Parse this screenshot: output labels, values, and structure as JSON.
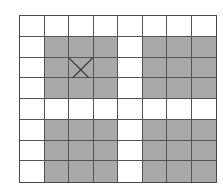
{
  "diagram": {
    "type": "grid",
    "rows": 8,
    "cols": 8,
    "colors": {
      "white": "#ffffff",
      "gray": "#a9a9a9",
      "line": "#555555"
    },
    "cells": [
      [
        0,
        0,
        0,
        0,
        0,
        0,
        0,
        0
      ],
      [
        0,
        1,
        1,
        1,
        0,
        1,
        1,
        1
      ],
      [
        0,
        1,
        1,
        1,
        0,
        1,
        1,
        1
      ],
      [
        0,
        1,
        1,
        1,
        0,
        1,
        1,
        1
      ],
      [
        0,
        0,
        0,
        0,
        0,
        0,
        0,
        0
      ],
      [
        0,
        1,
        1,
        1,
        0,
        1,
        1,
        1
      ],
      [
        0,
        1,
        1,
        1,
        0,
        1,
        1,
        1
      ],
      [
        0,
        1,
        1,
        1,
        0,
        1,
        1,
        1
      ]
    ],
    "marks": [
      {
        "row": 2,
        "col": 2,
        "symbol": "X"
      }
    ]
  }
}
